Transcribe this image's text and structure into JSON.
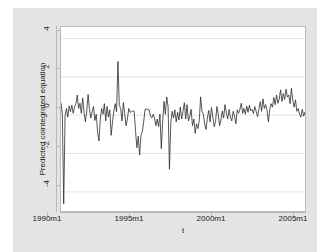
{
  "chart_data": {
    "type": "line",
    "title": "",
    "xlabel": "t",
    "ylabel": "Predicted cointegrated equation",
    "xlim": [
      1990.0,
      2005.0
    ],
    "ylim": [
      -5.0,
      4.6
    ],
    "grid": true,
    "grid_axis": "y",
    "legend": "none",
    "xtick_labels": [
      "1990m1",
      "1995m1",
      "2000m1",
      "2005m1"
    ],
    "xtick_values": [
      1990.0,
      1995.0,
      2000.0,
      2005.0
    ],
    "ytick_labels": [
      "4",
      "2",
      "0",
      "-2",
      "-4"
    ],
    "ytick_values": [
      4,
      2,
      0,
      -2,
      -4
    ],
    "line_color": "#26282b",
    "series": [
      {
        "name": "Predicted cointegrated equation",
        "x_start": 1990.0,
        "x_step": 0.08333,
        "values": [
          0.62,
          0.05,
          -4.62,
          -0.05,
          0.35,
          -0.1,
          0.48,
          0.18,
          0.52,
          0.1,
          0.42,
          0.6,
          1.05,
          0.35,
          0.62,
          0.1,
          0.9,
          0.15,
          -0.35,
          0.22,
          1.08,
          0.3,
          -0.15,
          0.2,
          0.45,
          -0.28,
          0.05,
          -0.9,
          -1.35,
          -0.2,
          0.35,
          0.05,
          0.6,
          -0.3,
          0.45,
          -0.1,
          0.28,
          -1.05,
          -0.35,
          0.22,
          0.6,
          0.18,
          2.8,
          0.55,
          0.35,
          -0.3,
          0.65,
          0.1,
          -0.55,
          -0.2,
          0.35,
          0.15,
          0.18,
          0.22,
          0.2,
          -0.85,
          -1.7,
          -1.1,
          -2.08,
          -1.05,
          -0.85,
          -0.35,
          0.3,
          0.32,
          0.3,
          0.28,
          -0.05,
          -0.15,
          0.05,
          -0.15,
          -0.55,
          -0.2,
          -0.6,
          0.05,
          -1.75,
          -0.35,
          0.72,
          0.05,
          0.95,
          0.45,
          -2.82,
          -0.4,
          0.2,
          -0.15,
          0.28,
          -0.35,
          0.15,
          -0.25,
          0.42,
          -0.2,
          0.2,
          0.65,
          -0.2,
          0.55,
          -0.3,
          -0.05,
          0.3,
          -0.55,
          -0.2,
          -0.95,
          -0.45,
          -0.7,
          -0.3,
          0.95,
          0.2,
          0.05,
          -0.45,
          -0.75,
          -0.15,
          0.25,
          -0.35,
          0.4,
          -0.1,
          -0.6,
          -0.35,
          0.45,
          0.05,
          -0.55,
          -0.25,
          0.22,
          -0.15,
          0.55,
          0.12,
          -0.2,
          0.3,
          -0.1,
          -0.3,
          0.2,
          -0.05,
          -0.45,
          0.28,
          0.1,
          0.3,
          0.62,
          0.1,
          0.35,
          0.05,
          0.48,
          0.15,
          0.52,
          0.22,
          0.3,
          0.08,
          0.45,
          0.2,
          -0.08,
          0.32,
          0.7,
          0.2,
          0.85,
          0.35,
          0.55,
          0.25,
          -0.35,
          0.3,
          0.6,
          0.42,
          0.92,
          0.55,
          1.05,
          0.62,
          0.85,
          1.32,
          0.72,
          1.12,
          0.82,
          1.35,
          0.95,
          1.05,
          0.6,
          1.4,
          0.75,
          0.42,
          0.8,
          0.2,
          0.35,
          0.05,
          -0.1,
          0.3,
          -0.05,
          0.15,
          -0.22,
          1.52,
          0.25,
          -0.15,
          -0.4,
          -0.05,
          -0.55,
          -0.3,
          -0.65,
          -0.45,
          -0.85,
          -0.55,
          -0.95,
          -0.6,
          -1.05,
          -0.75,
          -0.62,
          -0.95,
          -0.7,
          -1.25,
          -0.8,
          -1.62,
          -1.05,
          -0.75,
          -0.55,
          -0.9,
          -0.62,
          -0.78
        ]
      }
    ]
  }
}
